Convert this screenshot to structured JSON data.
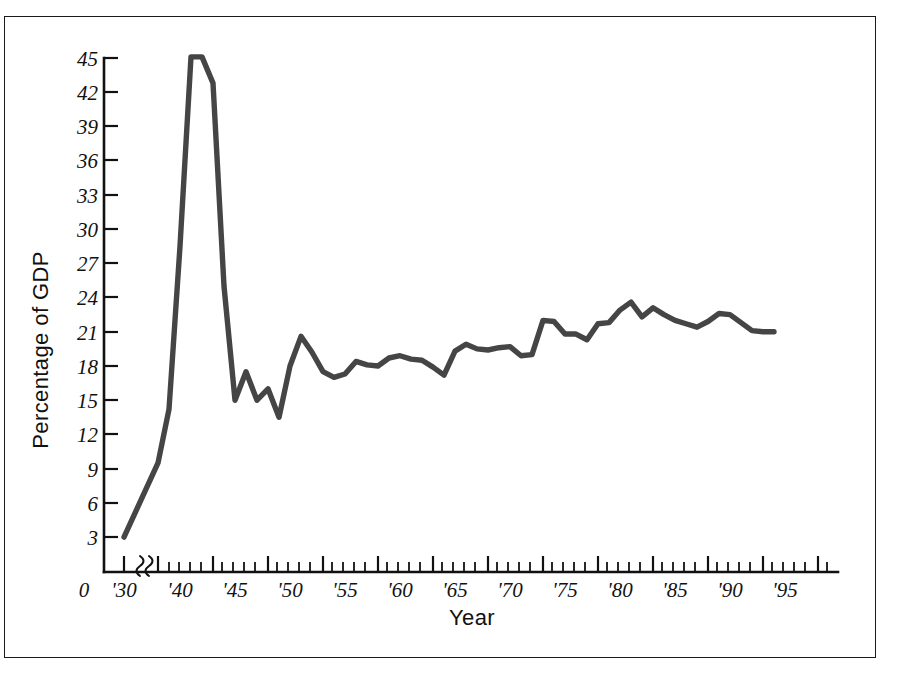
{
  "figure": {
    "border_color": "#1a1a1a",
    "background": "#ffffff"
  },
  "axes": {
    "y_title": "Percentage of GDP",
    "x_title": "Year",
    "y_ticks": [
      "0",
      "3",
      "6",
      "9",
      "12",
      "15",
      "18",
      "21",
      "24",
      "27",
      "30",
      "33",
      "36",
      "39",
      "42",
      "45"
    ],
    "x_ticks": [
      "0",
      "'30",
      "'40",
      "'45",
      "'50",
      "'55",
      "'60",
      "'65",
      "'70",
      "'75",
      "'80",
      "'85",
      "'90",
      "'95"
    ],
    "axis_break_between": [
      "'30",
      "'40"
    ],
    "line_color": "#454545"
  },
  "chart_data": {
    "type": "line",
    "title": "",
    "subtitle": "",
    "xlabel": "Year",
    "ylabel": "Percentage of GDP",
    "xlim": [
      1930,
      1996
    ],
    "ylim": [
      0,
      45
    ],
    "ytick_values": [
      0,
      3,
      6,
      9,
      12,
      15,
      18,
      21,
      24,
      27,
      30,
      33,
      36,
      39,
      42,
      45
    ],
    "xtick_labels": [
      "'30",
      "'40",
      "'45",
      "'50",
      "'55",
      "'60",
      "'65",
      "'70",
      "'75",
      "'80",
      "'85",
      "'90",
      "'95"
    ],
    "xtick_values": [
      1930,
      1940,
      1945,
      1950,
      1955,
      1960,
      1965,
      1970,
      1975,
      1980,
      1985,
      1990,
      1995
    ],
    "minor_tick_interval": 1,
    "axis_break": {
      "after": 1930,
      "before": 1940
    },
    "grid": false,
    "legend": false,
    "legend_position": "none",
    "annotations": [],
    "series": [
      {
        "name": "Federal spending as percentage of GDP",
        "color": "#454545",
        "x": [
          1930,
          1940,
          1941,
          1942,
          1943,
          1944,
          1945,
          1946,
          1947,
          1948,
          1949,
          1950,
          1951,
          1952,
          1953,
          1954,
          1955,
          1956,
          1957,
          1958,
          1959,
          1960,
          1961,
          1962,
          1963,
          1964,
          1965,
          1966,
          1967,
          1968,
          1969,
          1970,
          1971,
          1972,
          1973,
          1974,
          1975,
          1976,
          1977,
          1978,
          1979,
          1980,
          1981,
          1982,
          1983,
          1984,
          1985,
          1986,
          1987,
          1988,
          1989,
          1990,
          1991,
          1992,
          1993,
          1994,
          1995,
          1996
        ],
        "y": [
          3.0,
          9.5,
          14.2,
          28.5,
          45.1,
          45.1,
          42.8,
          25.0,
          15.0,
          17.5,
          15.0,
          16.0,
          13.5,
          18.0,
          20.6,
          19.2,
          17.5,
          17.0,
          17.3,
          18.4,
          18.1,
          18.0,
          18.7,
          18.9,
          18.6,
          18.5,
          17.9,
          17.2,
          19.3,
          19.9,
          19.5,
          19.4,
          19.6,
          19.7,
          18.9,
          19.0,
          22.0,
          21.9,
          20.8,
          20.8,
          20.3,
          21.7,
          21.8,
          22.9,
          23.6,
          22.3,
          23.1,
          22.5,
          22.0,
          21.7,
          21.4,
          21.9,
          22.6,
          22.5,
          21.8,
          21.1,
          21.0,
          21.0
        ]
      }
    ]
  }
}
